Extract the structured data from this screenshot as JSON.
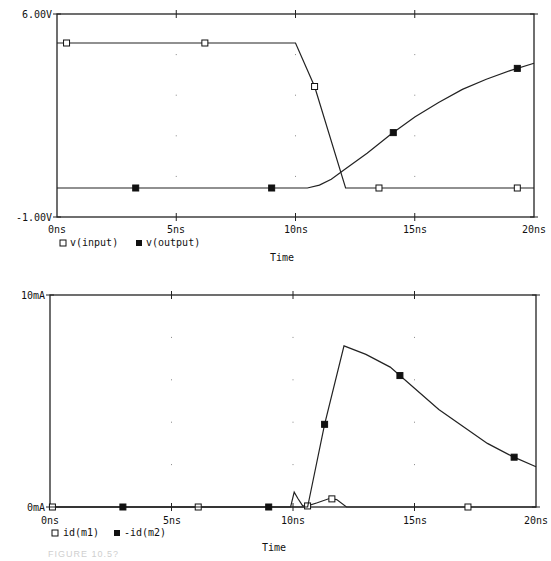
{
  "chart_data": [
    {
      "type": "line",
      "title": "",
      "xlabel": "Time",
      "ylabel": "",
      "x_ticks": [
        "0ns",
        "5ns",
        "10ns",
        "15ns",
        "20ns"
      ],
      "y_ticks": [
        "6.00V",
        "-1.00V"
      ],
      "xlim": [
        0,
        20
      ],
      "ylim": [
        -1.0,
        6.0
      ],
      "grid": "dotted",
      "legend_position": "bottom-left",
      "series": [
        {
          "name": "v(input)",
          "marker": "open-square",
          "x": [
            0,
            10.0,
            10.8,
            12.1,
            20
          ],
          "values": [
            5.0,
            5.0,
            3.5,
            0.0,
            0.0
          ],
          "marker_x": [
            0.4,
            6.2,
            10.8,
            13.5,
            19.3
          ]
        },
        {
          "name": "v(output)",
          "marker": "filled-square",
          "x": [
            0,
            10.5,
            11.0,
            11.5,
            12.0,
            13.0,
            14.0,
            15.0,
            16.0,
            17.0,
            18.0,
            19.0,
            20.0
          ],
          "values": [
            0.0,
            0.0,
            0.1,
            0.3,
            0.6,
            1.2,
            1.85,
            2.45,
            2.95,
            3.4,
            3.75,
            4.05,
            4.3
          ],
          "marker_x": [
            3.3,
            9.0,
            14.1,
            19.3
          ]
        }
      ]
    },
    {
      "type": "line",
      "title": "",
      "xlabel": "Time",
      "ylabel": "",
      "x_ticks": [
        "0ns",
        "5ns",
        "10ns",
        "15ns",
        "20ns"
      ],
      "y_ticks": [
        "10mA",
        "0mA"
      ],
      "xlim": [
        0,
        20
      ],
      "ylim": [
        0,
        10
      ],
      "grid": "dotted",
      "legend_position": "bottom-left",
      "series": [
        {
          "name": "id(m1)",
          "marker": "open-square",
          "x": [
            0,
            9.9,
            10.05,
            10.2,
            10.4,
            10.6,
            11.0,
            11.5,
            11.8,
            12.2,
            20
          ],
          "values": [
            0,
            0,
            0.7,
            0.4,
            0.05,
            0.05,
            0.2,
            0.4,
            0.35,
            0.0,
            0.0
          ],
          "marker_x": [
            0.1,
            6.1,
            10.6,
            11.6,
            17.2
          ]
        },
        {
          "name": "-id(m2)",
          "marker": "filled-square",
          "x": [
            0,
            10.6,
            11.3,
            12.1,
            13.0,
            14.0,
            15.0,
            16.0,
            17.0,
            18.0,
            19.0,
            20.0
          ],
          "values": [
            0,
            0,
            3.9,
            7.6,
            7.2,
            6.6,
            5.6,
            4.6,
            3.8,
            3.0,
            2.4,
            1.9
          ],
          "marker_x": [
            3.0,
            9.0,
            11.3,
            14.4,
            19.1
          ]
        }
      ]
    }
  ],
  "top_chart": {
    "y_top_label": "6.00V",
    "y_bottom_label": "-1.00V",
    "x_labels": [
      "0ns",
      "5ns",
      "10ns",
      "15ns",
      "20ns"
    ],
    "legend": [
      {
        "marker": "open-square",
        "label": "v(input)"
      },
      {
        "marker": "filled-square",
        "label": "v(output)"
      }
    ],
    "xlabel": "Time"
  },
  "bottom_chart": {
    "y_top_label": "10mA",
    "y_bottom_label": "0mA",
    "x_labels": [
      "0ns",
      "5ns",
      "10ns",
      "15ns",
      "20ns"
    ],
    "legend": [
      {
        "marker": "open-square",
        "label": "id(m1)"
      },
      {
        "marker": "filled-square",
        "label": "-id(m2)"
      }
    ],
    "xlabel": "Time"
  },
  "caption": "FIGURE 10.5?"
}
